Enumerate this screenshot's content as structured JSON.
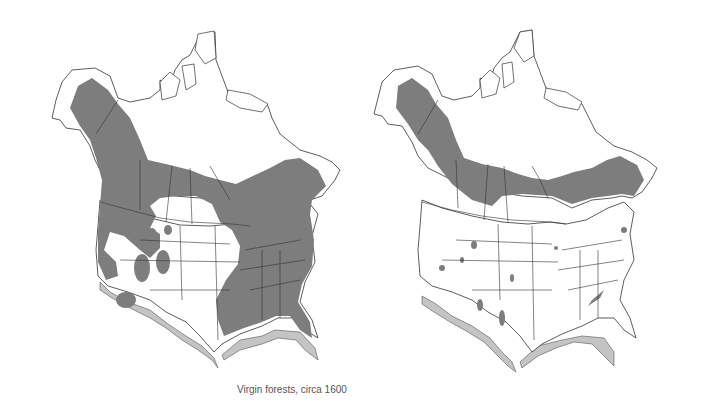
{
  "maps": [
    {
      "caption": "Virgin forests, circa 1600",
      "region": "North America (Canada, Alaska, contiguous United States)",
      "forest_extent": "extensive — covers most of eastern US, Pacific Northwest, Rocky Mountains, and boreal Canada/Alaska"
    },
    {
      "caption": "Virgin forests,  1993",
      "region": "North America (Canada, Alaska, contiguous United States)",
      "forest_extent": "reduced — mainly boreal Canada/Alaska belt; only small scattered patches in the contiguous US"
    }
  ],
  "colors": {
    "background": "#ffffff",
    "land": "#ffffff",
    "forest": "#7d7d7d",
    "coast_shadow": "#c4c4c4",
    "border": "#333333",
    "caption_text": "#555555"
  }
}
